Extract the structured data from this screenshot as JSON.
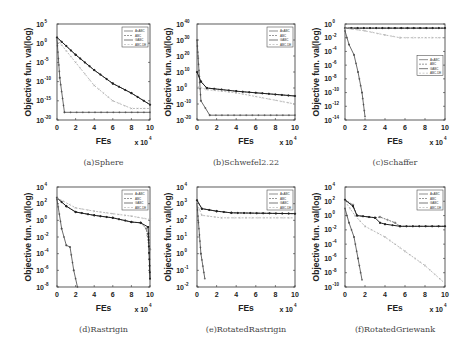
{
  "figure": {
    "legend": [
      "AsABC",
      "ABC",
      "GABC",
      "ABC-DE"
    ],
    "xlabel": "FEs",
    "xscale_note": "x 10^4",
    "ylabel": "Objective fun. val(log)"
  },
  "chart_data": [
    {
      "type": "line",
      "title": "(a)Sphere",
      "xlabel": "FEs",
      "ylabel": "Objective fun. val(log)",
      "x_ticks": [
        0,
        2,
        4,
        6,
        8,
        10
      ],
      "x_multiplier": "x 10^4",
      "y_ticks_exp": [
        5,
        0,
        -5,
        -10,
        -15,
        -20
      ],
      "ylim_exp": [
        -20,
        5
      ],
      "yscale": "log",
      "legend_position": "upper right",
      "series": [
        {
          "name": "AsABC",
          "x": [
            0,
            0.3,
            0.8,
            10
          ],
          "log10_y": [
            1,
            -9,
            -18,
            -18
          ]
        },
        {
          "name": "ABC",
          "x": [
            0,
            2,
            4,
            6,
            8,
            10
          ],
          "log10_y": [
            1.5,
            -3,
            -7,
            -10.5,
            -13,
            -16
          ]
        },
        {
          "name": "GABC",
          "x": [
            0,
            2,
            4,
            6,
            8,
            10
          ],
          "log10_y": [
            1.5,
            -3,
            -7,
            -10.5,
            -13,
            -16
          ]
        },
        {
          "name": "ABC-DE",
          "x": [
            0,
            2,
            4,
            6,
            8,
            10
          ],
          "log10_y": [
            1,
            -5,
            -11,
            -15,
            -17,
            -17
          ]
        }
      ]
    },
    {
      "type": "line",
      "title": "(b)Schwefel2.22",
      "xlabel": "FEs",
      "ylabel": "Objective fun. val(log)",
      "x_ticks": [
        0,
        2,
        4,
        6,
        8,
        10
      ],
      "x_multiplier": "x 10^4",
      "y_ticks_exp": [
        40,
        30,
        20,
        10,
        0,
        -10,
        -20
      ],
      "ylim_exp": [
        -20,
        40
      ],
      "yscale": "log",
      "legend_position": "upper right",
      "series": [
        {
          "name": "AsABC",
          "x": [
            0,
            0.4,
            1.3,
            10
          ],
          "log10_y": [
            30,
            -8,
            -17,
            -17
          ]
        },
        {
          "name": "ABC",
          "x": [
            0,
            0.4,
            1,
            4,
            10
          ],
          "log10_y": [
            10,
            4,
            0,
            -2,
            -5
          ]
        },
        {
          "name": "GABC",
          "x": [
            0,
            0.4,
            1,
            4,
            10
          ],
          "log10_y": [
            10,
            4,
            0,
            -2,
            -5
          ]
        },
        {
          "name": "ABC-DE",
          "x": [
            0,
            1,
            4,
            10
          ],
          "log10_y": [
            1,
            -1,
            -3,
            -10
          ]
        }
      ]
    },
    {
      "type": "line",
      "title": "(c)Schaffer",
      "xlabel": "FEs",
      "ylabel": "Objective fun. val(log)",
      "x_ticks": [
        0,
        2,
        4,
        6,
        8,
        10
      ],
      "x_multiplier": "x 10^4",
      "y_ticks_exp": [
        0,
        -2,
        -4,
        -6,
        -8,
        -10,
        -12,
        -14
      ],
      "ylim_exp": [
        -14,
        0
      ],
      "yscale": "log",
      "legend_position": "center right",
      "series": [
        {
          "name": "AsABC",
          "x": [
            0,
            0.4,
            0.9,
            1.3,
            1.7,
            2.0
          ],
          "log10_y": [
            -1,
            -3,
            -4.5,
            -7,
            -10,
            -13.5
          ]
        },
        {
          "name": "ABC",
          "x": [
            0,
            10
          ],
          "log10_y": [
            -0.6,
            -0.6
          ]
        },
        {
          "name": "GABC",
          "x": [
            0,
            10
          ],
          "log10_y": [
            -0.6,
            -0.6
          ]
        },
        {
          "name": "ABC-DE",
          "x": [
            0,
            2,
            4,
            5.5,
            10
          ],
          "log10_y": [
            -0.6,
            -1,
            -1.6,
            -2,
            -2
          ]
        }
      ]
    },
    {
      "type": "line",
      "title": "(d)Rastrigin",
      "xlabel": "FEs",
      "ylabel": "Objective fun. val(log)",
      "x_ticks": [
        0,
        2,
        4,
        6,
        8,
        10
      ],
      "x_multiplier": "x 10^4",
      "y_ticks_exp": [
        4,
        2,
        0,
        -2,
        -4,
        -6,
        -8
      ],
      "ylim_exp": [
        -8,
        4
      ],
      "yscale": "log",
      "legend_position": "upper right",
      "series": [
        {
          "name": "AsABC",
          "x": [
            0,
            0.5,
            1,
            1.4,
            1.8,
            2.2
          ],
          "log10_y": [
            2.5,
            -1,
            -3,
            -3.2,
            -6,
            -8
          ]
        },
        {
          "name": "ABC",
          "x": [
            0,
            1,
            2,
            4,
            6,
            8,
            9,
            9.6,
            10
          ],
          "log10_y": [
            2.7,
            1.7,
            1,
            0.6,
            0.3,
            -0.2,
            -0.3,
            -1,
            -3.5
          ]
        },
        {
          "name": "GABC",
          "x": [
            0,
            1,
            2,
            4,
            6,
            8,
            9,
            9.8,
            10
          ],
          "log10_y": [
            2.7,
            1.7,
            1,
            0.6,
            0.3,
            -0.2,
            -0.3,
            -0.8,
            -7
          ]
        },
        {
          "name": "ABC-DE",
          "x": [
            0,
            2,
            4,
            6,
            8,
            10
          ],
          "log10_y": [
            2.7,
            1.5,
            1.1,
            0.8,
            0.5,
            0.1
          ]
        }
      ]
    },
    {
      "type": "line",
      "title": "(e)RotatedRastrigin",
      "xlabel": "FEs",
      "ylabel": "Objective fun. val(log)",
      "x_ticks": [
        0,
        2,
        4,
        6,
        8,
        10
      ],
      "x_multiplier": "x 10^4",
      "y_ticks_exp": [
        4,
        3,
        2,
        1,
        0,
        -1,
        -2
      ],
      "ylim_exp": [
        -2,
        4
      ],
      "yscale": "log",
      "legend_position": "upper right",
      "series": [
        {
          "name": "AsABC",
          "x": [
            0,
            0.4,
            0.8
          ],
          "log10_y": [
            3,
            0,
            -1.5
          ]
        },
        {
          "name": "ABC",
          "x": [
            0,
            0.5,
            2,
            3.5,
            10
          ],
          "log10_y": [
            3.2,
            2.7,
            2.55,
            2.45,
            2.4
          ]
        },
        {
          "name": "GABC",
          "x": [
            0,
            0.5,
            2,
            3.5,
            10
          ],
          "log10_y": [
            3.2,
            2.7,
            2.55,
            2.45,
            2.4
          ]
        },
        {
          "name": "ABC-DE",
          "x": [
            0,
            0.5,
            2.5,
            10
          ],
          "log10_y": [
            3,
            2.3,
            2.15,
            2.15
          ]
        }
      ]
    },
    {
      "type": "line",
      "title": "(f)RotatedGriewank",
      "xlabel": "FEs",
      "ylabel": "Objective fun. val(log)",
      "x_ticks": [
        0,
        2,
        4,
        6,
        8,
        10
      ],
      "x_multiplier": "x 10^4",
      "y_ticks_exp": [
        4,
        2,
        0,
        -2,
        -4,
        -6,
        -8,
        -10
      ],
      "ylim_exp": [
        -10,
        4
      ],
      "yscale": "log",
      "legend_position": "upper right",
      "series": [
        {
          "name": "AsABC",
          "x": [
            0,
            0.4,
            0.9,
            1.3,
            1.7
          ],
          "log10_y": [
            1,
            -1,
            -3,
            -6,
            -9
          ]
        },
        {
          "name": "ABC",
          "x": [
            0,
            0.8,
            1.2,
            3,
            3.5,
            5,
            5.5,
            10
          ],
          "log10_y": [
            2.2,
            1.5,
            0,
            -0.3,
            -0.2,
            -1,
            -1.5,
            -1.5
          ]
        },
        {
          "name": "GABC",
          "x": [
            0,
            0.8,
            1.2,
            3,
            3.5,
            4,
            5.5,
            10
          ],
          "log10_y": [
            2.2,
            1.3,
            0,
            -0.3,
            -1,
            -1.2,
            -1.5,
            -1.5
          ]
        },
        {
          "name": "ABC-DE",
          "x": [
            0,
            1,
            2,
            4,
            6,
            8,
            10
          ],
          "log10_y": [
            2,
            0,
            -1.5,
            -3,
            -5,
            -7,
            -9.5
          ]
        }
      ]
    }
  ]
}
